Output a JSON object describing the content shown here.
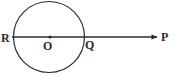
{
  "figure": {
    "background_color": "#ffffff",
    "stroke_color": "#2b2b2b",
    "width": 175,
    "height": 77
  },
  "circle": {
    "name": "main-circle",
    "center_x": 49,
    "center_y": 37,
    "radius": 35.5,
    "stroke_width": 1.2
  },
  "line": {
    "name": "ray-R-to-P",
    "start_x": 12,
    "start_y": 37,
    "end_x": 158,
    "end_y": 37,
    "stroke_width": 1.3,
    "has_arrowhead": true,
    "arrowhead_x": 157
  },
  "markers": [
    {
      "name": "center-point-O",
      "x": 50,
      "y": 37,
      "radius": 1.6,
      "filled": true
    },
    {
      "name": "arrow-tip-point-P",
      "x": 156,
      "y": 37,
      "radius": 1.9,
      "filled": true
    }
  ],
  "labels": {
    "R": "R",
    "O": "O",
    "Q": "Q",
    "P": "P"
  }
}
